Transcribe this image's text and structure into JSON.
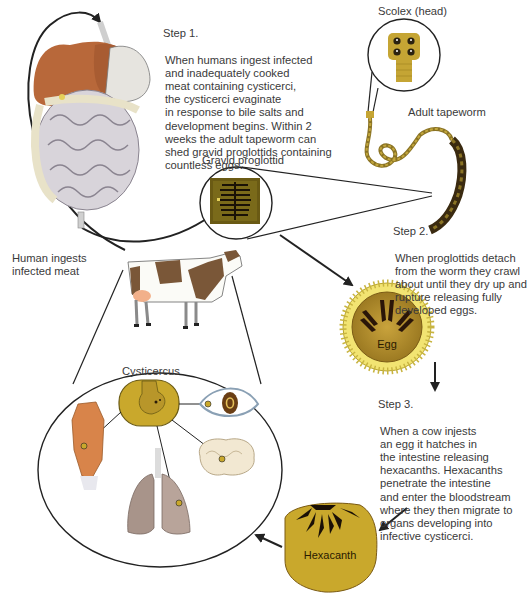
{
  "steps": [
    {
      "heading": "Step 1.",
      "body": "When humans ingest infected\nand inadequately cooked\nmeat containing cysticerci,\nthe cysticerci evaginate\nin response to bile salts and\ndevelopment begins. Within 2\nweeks the adult tapeworm can\nshed gravid proglottids containing\ncountless eggs."
    },
    {
      "heading": "Step 2.",
      "body": "When proglottids detach\nfrom the worm they crawl\nabout until they dry up and\nrupture releasing fully\ndeveloped eggs."
    },
    {
      "heading": "Step 3.",
      "body": "When a cow injests\nan egg it hatches in\nthe intestine releasing\nhexacanths. Hexacanths\npenetrate the intestine\nand enter the bloodstream\nwhere they then migrate to\norgans developing into\ninfective cysticerci."
    }
  ],
  "labels": {
    "scolex": "Scolex (head)",
    "adult_tapeworm": "Adult tapeworm",
    "gravid_proglottid": "Gravid proglottid",
    "human_ingests": "Human ingests\ninfected meat",
    "egg": "Egg",
    "cysticercus": "Cysticercus",
    "hexacanth": "Hexacanth"
  },
  "icons": [
    "digestive-system-icon",
    "scolex-icon",
    "tapeworm-icon",
    "proglottid-icon",
    "cow-icon",
    "egg-icon",
    "cysticercus-icon",
    "eye-icon",
    "muscle-icon",
    "brain-icon",
    "lungs-icon",
    "hexacanth-icon"
  ],
  "colors": {
    "parasite_gold": "#c9a82c",
    "parasite_dark": "#2a1a08",
    "egg_rim": "#f3e77a",
    "liver": "#b8683a",
    "intestine": "#d8d4da",
    "line": "#222222"
  }
}
